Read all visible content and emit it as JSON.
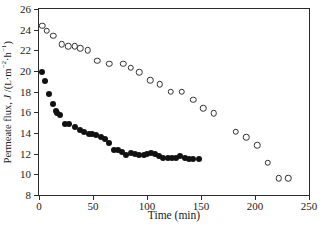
{
  "chart_data": {
    "type": "scatter",
    "title": "",
    "xlabel": "Time (min)",
    "ylabel": "Permeate flux, J /(L·m⁻²·h⁻¹)",
    "ylabel_parts": {
      "prefix": "Permeate flux, ",
      "symbol": "J",
      "units_open": " /(",
      "units_L": "L",
      "units_mid": "·m",
      "units_exp1": "−2",
      "units_h": "·h",
      "units_exp2": "−1",
      "units_close": ")"
    },
    "xlim": [
      0,
      250
    ],
    "ylim": [
      8,
      26
    ],
    "xticks": [
      0,
      50,
      100,
      150,
      200,
      250
    ],
    "yticks": [
      8,
      10,
      12,
      14,
      16,
      18,
      20,
      22,
      24,
      26
    ],
    "xtick_labels": [
      "0",
      "50",
      "100",
      "150",
      "200",
      "250"
    ],
    "ytick_labels": [
      "8",
      "10",
      "12",
      "14",
      "16",
      "18",
      "20",
      "22",
      "24",
      "26"
    ],
    "grid": false,
    "legend_position": "none",
    "marker_colors": {
      "filled": "#111111",
      "open_edge": "#303030",
      "open_face": "#ffffff",
      "axis": "#2b2b2b"
    },
    "series": [
      {
        "name": "open-circles",
        "marker": "open-circle",
        "points": [
          [
            3,
            24.4
          ],
          [
            7,
            23.9
          ],
          [
            13,
            23.4
          ],
          [
            21,
            22.6
          ],
          [
            27,
            22.4
          ],
          [
            33,
            22.4
          ],
          [
            38,
            22.2
          ],
          [
            45,
            22.0
          ],
          [
            54,
            21.0
          ],
          [
            65,
            20.7
          ],
          [
            78,
            20.7
          ],
          [
            85,
            20.3
          ],
          [
            93,
            19.9
          ],
          [
            103,
            19.1
          ],
          [
            112,
            18.7
          ],
          [
            122,
            18.0
          ],
          [
            132,
            18.0
          ],
          [
            143,
            17.2
          ],
          [
            152,
            16.4
          ],
          [
            162,
            15.9
          ],
          [
            182,
            14.1
          ],
          [
            192,
            13.6
          ],
          [
            202,
            12.8
          ],
          [
            212,
            11.1
          ],
          [
            222,
            9.6
          ],
          [
            231,
            9.6
          ]
        ]
      },
      {
        "name": "filled-circles",
        "marker": "filled-circle",
        "points": [
          [
            3,
            19.9
          ],
          [
            6,
            19.0
          ],
          [
            9,
            17.8
          ],
          [
            13,
            16.8
          ],
          [
            16,
            16.1
          ],
          [
            17,
            15.9
          ],
          [
            19,
            15.7
          ],
          [
            24,
            14.9
          ],
          [
            28,
            14.9
          ],
          [
            33,
            14.6
          ],
          [
            38,
            14.3
          ],
          [
            42,
            14.1
          ],
          [
            46,
            13.9
          ],
          [
            49,
            13.9
          ],
          [
            53,
            13.8
          ],
          [
            57,
            13.6
          ],
          [
            61,
            13.4
          ],
          [
            65,
            13.0
          ],
          [
            69,
            12.4
          ],
          [
            73,
            12.4
          ],
          [
            77,
            12.2
          ],
          [
            81,
            11.9
          ],
          [
            85,
            12.1
          ],
          [
            89,
            12.0
          ],
          [
            93,
            11.9
          ],
          [
            97,
            11.9
          ],
          [
            100,
            12.0
          ],
          [
            104,
            12.1
          ],
          [
            107,
            12.0
          ],
          [
            111,
            11.8
          ],
          [
            115,
            11.6
          ],
          [
            119,
            11.6
          ],
          [
            123,
            11.6
          ],
          [
            127,
            11.6
          ],
          [
            131,
            11.8
          ],
          [
            135,
            11.6
          ],
          [
            139,
            11.5
          ],
          [
            143,
            11.5
          ],
          [
            148,
            11.5
          ]
        ]
      }
    ]
  }
}
